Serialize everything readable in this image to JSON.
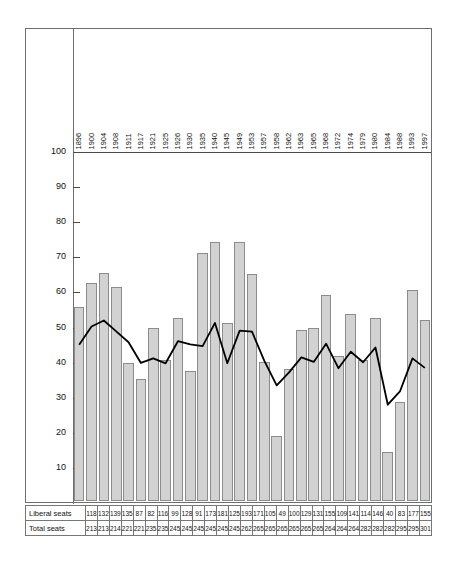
{
  "chart_data": {
    "type": "bar",
    "title": "",
    "subtitle": "",
    "xlabel": "",
    "ylabel": "",
    "ylim": [
      0,
      105
    ],
    "yticks": [
      10,
      20,
      30,
      40,
      50,
      60,
      70,
      80,
      90,
      100
    ],
    "grid": false,
    "legend_position": "none",
    "categories": [
      "1896",
      "1900",
      "1904",
      "1908",
      "1911",
      "1917",
      "1921",
      "1925",
      "1926",
      "1930",
      "1935",
      "1940",
      "1945",
      "1949",
      "1953",
      "1957",
      "1958",
      "1962",
      "1963",
      "1965",
      "1968",
      "1972",
      "1974",
      "1979",
      "1980",
      "1984",
      "1988",
      "1993",
      "1997"
    ],
    "series": [
      {
        "name": "Liberal seats as % of total seats",
        "type": "bar",
        "values": [
          55.4,
          62.0,
          65.0,
          61.1,
          39.4,
          34.8,
          49.2,
          40.1,
          52.2,
          37.1,
          70.6,
          73.9,
          50.8,
          73.7,
          64.8,
          39.6,
          18.5,
          37.7,
          48.7,
          49.4,
          58.7,
          41.3,
          53.4,
          40.1,
          52.1,
          13.9,
          28.1,
          60.0,
          51.5
        ]
      },
      {
        "name": "Liberal share of popular vote (%)",
        "type": "line",
        "values": [
          45.1,
          50.3,
          52.0,
          48.9,
          45.8,
          39.9,
          41.2,
          39.8,
          46.1,
          45.2,
          44.7,
          51.3,
          39.8,
          49.1,
          48.8,
          40.5,
          33.5,
          37.2,
          41.5,
          40.2,
          45.4,
          38.4,
          43.1,
          40.1,
          44.3,
          28.0,
          31.9,
          41.2,
          38.5
        ]
      }
    ],
    "table": {
      "rows": [
        {
          "label": "Liberal seats",
          "values": [
            "118",
            "132",
            "139",
            "135",
            "87",
            "82",
            "116",
            "99",
            "128",
            "91",
            "173",
            "181",
            "125",
            "193",
            "171",
            "105",
            "49",
            "100",
            "129",
            "131",
            "155",
            "109",
            "141",
            "114",
            "146",
            "40",
            "83",
            "177",
            "155"
          ]
        },
        {
          "label": "Total seats",
          "values": [
            "213",
            "213",
            "214",
            "221",
            "221",
            "235",
            "235",
            "245",
            "245",
            "245",
            "245",
            "245",
            "245",
            "262",
            "265",
            "265",
            "265",
            "265",
            "265",
            "265",
            "264",
            "264",
            "264",
            "282",
            "282",
            "282",
            "295",
            "295",
            "301"
          ]
        }
      ]
    },
    "colors": {
      "bar_fill": "#d2d2d2",
      "bar_stroke": "#8c8c8c",
      "line": "#000000",
      "axis": "#4a4a4a",
      "frame": "#6e6e6e"
    }
  }
}
